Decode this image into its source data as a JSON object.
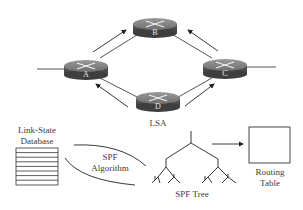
{
  "diagram": {
    "type": "link-state routing (OSPF) overview",
    "routers": [
      {
        "id": "A",
        "label": "A"
      },
      {
        "id": "B",
        "label": "B"
      },
      {
        "id": "C",
        "label": "C"
      },
      {
        "id": "D",
        "label": "D"
      }
    ],
    "links": [
      [
        "A",
        "B"
      ],
      [
        "B",
        "C"
      ],
      [
        "C",
        "D"
      ],
      [
        "D",
        "A"
      ]
    ],
    "flood_arrows": [
      "A→B",
      "C→B",
      "D→A",
      "D→C"
    ],
    "lsa_label": "LSA",
    "database": {
      "line1": "Link-State",
      "line2": "Database",
      "rows": 8
    },
    "algorithm": {
      "line1": "SPF",
      "line2": "Algorithm"
    },
    "tree_label": "SPF Tree",
    "routing_table": {
      "line1": "Routing",
      "line2": "Table"
    },
    "colors": {
      "router_top": "#8a8a8a",
      "router_side": "#555555",
      "line": "#2a2a2a",
      "background": "#ffffff"
    }
  }
}
